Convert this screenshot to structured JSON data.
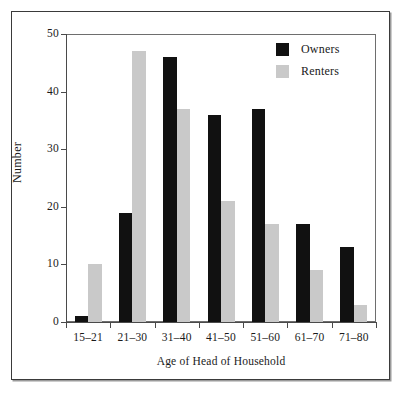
{
  "chart_data": {
    "type": "bar",
    "title": "",
    "xlabel": "Age of Head of Household",
    "ylabel": "Number",
    "categories": [
      "15–21",
      "21–30",
      "31–40",
      "41–50",
      "51–60",
      "61–70",
      "71–80"
    ],
    "series": [
      {
        "name": "Owners",
        "color": "#111111",
        "values": [
          1,
          19,
          46,
          36,
          37,
          17,
          13
        ]
      },
      {
        "name": "Renters",
        "color": "#c9c9c9",
        "values": [
          10,
          47,
          37,
          21,
          17,
          9,
          3
        ]
      }
    ],
    "ylim": [
      0,
      50
    ],
    "yticks": [
      0,
      10,
      20,
      30,
      40,
      50
    ],
    "ytick_labels": [
      "0",
      "10",
      "20",
      "30",
      "40",
      "50"
    ],
    "grid": true,
    "grid_axis": "y",
    "legend_position": "top-right",
    "legend_entries": [
      "Owners",
      "Renters"
    ],
    "bar_mode": "grouped"
  },
  "figure": {
    "frame_color": "#3a3a3a",
    "plot_border_color": "#6e6e6e",
    "gridline_color": "#8c8c8c",
    "background": "#ffffff"
  }
}
